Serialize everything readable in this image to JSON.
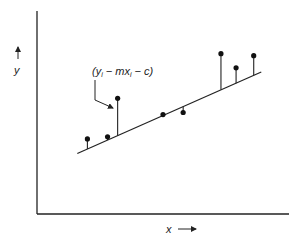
{
  "chart_data": {
    "type": "scatter",
    "title": "",
    "xlabel": "x",
    "ylabel": "y",
    "annotation": "(yᵢ − mxᵢ − c)",
    "annotation_parts": {
      "open": "(y",
      "sub1": "i",
      "mid": " − mx",
      "sub2": "i",
      "close": " − c)"
    },
    "grid": false,
    "xlim": [
      0,
      10
    ],
    "ylim": [
      0,
      10
    ],
    "fit_line": {
      "m": 0.55,
      "c": 2.1,
      "x_start": 1.6,
      "x_end": 8.9
    },
    "points": [
      {
        "x": 2.0,
        "y": 3.7
      },
      {
        "x": 2.8,
        "y": 3.8
      },
      {
        "x": 3.2,
        "y": 5.7
      },
      {
        "x": 5.0,
        "y": 4.9
      },
      {
        "x": 5.8,
        "y": 5.0
      },
      {
        "x": 7.3,
        "y": 7.9
      },
      {
        "x": 7.9,
        "y": 7.2
      },
      {
        "x": 8.6,
        "y": 7.8
      }
    ],
    "annotated_point_index": 2
  }
}
